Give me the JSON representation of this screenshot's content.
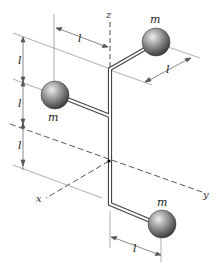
{
  "diagram": {
    "type": "mechanics-rigid-body",
    "axes": {
      "x": {
        "label": "x"
      },
      "y": {
        "label": "y"
      },
      "z": {
        "label": "z"
      }
    },
    "masses": [
      {
        "id": "top-right",
        "label": "m"
      },
      {
        "id": "middle-left",
        "label": "m"
      },
      {
        "id": "bottom-right",
        "label": "m"
      }
    ],
    "dimensions": {
      "top_horizontal": "l",
      "top_arm": "l",
      "vertical_1": "l",
      "vertical_2": "l",
      "vertical_3": "l",
      "bottom_arm": "l"
    },
    "colors": {
      "sphere": "#8a8a8a",
      "sphere_highlight": "#e6e6e6",
      "sphere_shadow": "#3c3c3c",
      "rod": "#555555",
      "line": "#555555"
    }
  }
}
